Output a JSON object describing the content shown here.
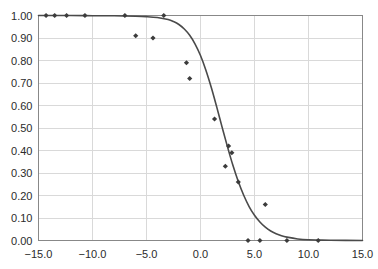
{
  "chart_data": {
    "type": "scatter",
    "title": "",
    "subtitle": "",
    "xlabel": "",
    "ylabel": "",
    "xlim": [
      -15.0,
      15.0
    ],
    "ylim": [
      0.0,
      1.0
    ],
    "xticks": [
      -15.0,
      -10.0,
      -5.0,
      0.0,
      5.0,
      10.0,
      15.0
    ],
    "xtick_labels": [
      "-15.0",
      "-10.0",
      "-5.0",
      "0.0",
      "5.0",
      "10.0",
      "15.0"
    ],
    "yticks": [
      0.0,
      0.1,
      0.2,
      0.3,
      0.4,
      0.5,
      0.6,
      0.7,
      0.8,
      0.9,
      1.0
    ],
    "ytick_labels": [
      "0.00",
      "0.10",
      "0.20",
      "0.30",
      "0.40",
      "0.50",
      "0.60",
      "0.70",
      "0.80",
      "0.90",
      "1.00"
    ],
    "grid": {
      "horizontal": true,
      "vertical": true
    },
    "legend": {
      "visible": false,
      "position": "none"
    },
    "annotations": [],
    "series": [
      {
        "name": "observed",
        "type": "scatter",
        "marker": "diamond",
        "color": "#3c3c3c",
        "points": [
          {
            "x": -14.3,
            "y": 1.0
          },
          {
            "x": -13.5,
            "y": 1.0
          },
          {
            "x": -12.4,
            "y": 1.0
          },
          {
            "x": -10.7,
            "y": 1.0
          },
          {
            "x": -7.0,
            "y": 1.0
          },
          {
            "x": -3.4,
            "y": 1.0
          },
          {
            "x": -6.0,
            "y": 0.91
          },
          {
            "x": -4.4,
            "y": 0.9
          },
          {
            "x": -1.3,
            "y": 0.79
          },
          {
            "x": -1.0,
            "y": 0.72
          },
          {
            "x": 1.3,
            "y": 0.54
          },
          {
            "x": 2.6,
            "y": 0.42
          },
          {
            "x": 2.9,
            "y": 0.39
          },
          {
            "x": 2.3,
            "y": 0.33
          },
          {
            "x": 3.5,
            "y": 0.26
          },
          {
            "x": 6.0,
            "y": 0.16
          },
          {
            "x": 4.4,
            "y": 0.0
          },
          {
            "x": 5.5,
            "y": 0.0
          },
          {
            "x": 8.0,
            "y": 0.0
          },
          {
            "x": 10.9,
            "y": 0.0
          }
        ]
      },
      {
        "name": "fitted-curve",
        "type": "line",
        "color": "#4a4a4a",
        "points": [
          {
            "x": -15.0,
            "y": 1.0
          },
          {
            "x": -12.0,
            "y": 1.0
          },
          {
            "x": -10.0,
            "y": 0.999
          },
          {
            "x": -8.0,
            "y": 0.999
          },
          {
            "x": -6.0,
            "y": 0.997
          },
          {
            "x": -5.0,
            "y": 0.995
          },
          {
            "x": -4.0,
            "y": 0.991
          },
          {
            "x": -3.0,
            "y": 0.982
          },
          {
            "x": -2.5,
            "y": 0.973
          },
          {
            "x": -2.0,
            "y": 0.96
          },
          {
            "x": -1.5,
            "y": 0.94
          },
          {
            "x": -1.0,
            "y": 0.912
          },
          {
            "x": -0.5,
            "y": 0.873
          },
          {
            "x": 0.0,
            "y": 0.822
          },
          {
            "x": 0.5,
            "y": 0.757
          },
          {
            "x": 1.0,
            "y": 0.68
          },
          {
            "x": 1.5,
            "y": 0.594
          },
          {
            "x": 2.0,
            "y": 0.504
          },
          {
            "x": 2.5,
            "y": 0.416
          },
          {
            "x": 3.0,
            "y": 0.334
          },
          {
            "x": 3.5,
            "y": 0.262
          },
          {
            "x": 4.0,
            "y": 0.201
          },
          {
            "x": 4.5,
            "y": 0.151
          },
          {
            "x": 5.0,
            "y": 0.112
          },
          {
            "x": 5.5,
            "y": 0.082
          },
          {
            "x": 6.0,
            "y": 0.059
          },
          {
            "x": 6.5,
            "y": 0.042
          },
          {
            "x": 7.0,
            "y": 0.03
          },
          {
            "x": 7.5,
            "y": 0.021
          },
          {
            "x": 8.0,
            "y": 0.015
          },
          {
            "x": 9.0,
            "y": 0.007
          },
          {
            "x": 10.0,
            "y": 0.003
          },
          {
            "x": 11.0,
            "y": 0.002
          },
          {
            "x": 12.0,
            "y": 0.001
          },
          {
            "x": 15.0,
            "y": 0.0
          }
        ]
      }
    ]
  },
  "colors": {
    "marker": "#3c3c3c",
    "curve": "#4a4a4a",
    "grid": "#d9d9d9",
    "frame": "#888888",
    "text": "#2b2b2b",
    "background": "#ffffff"
  }
}
